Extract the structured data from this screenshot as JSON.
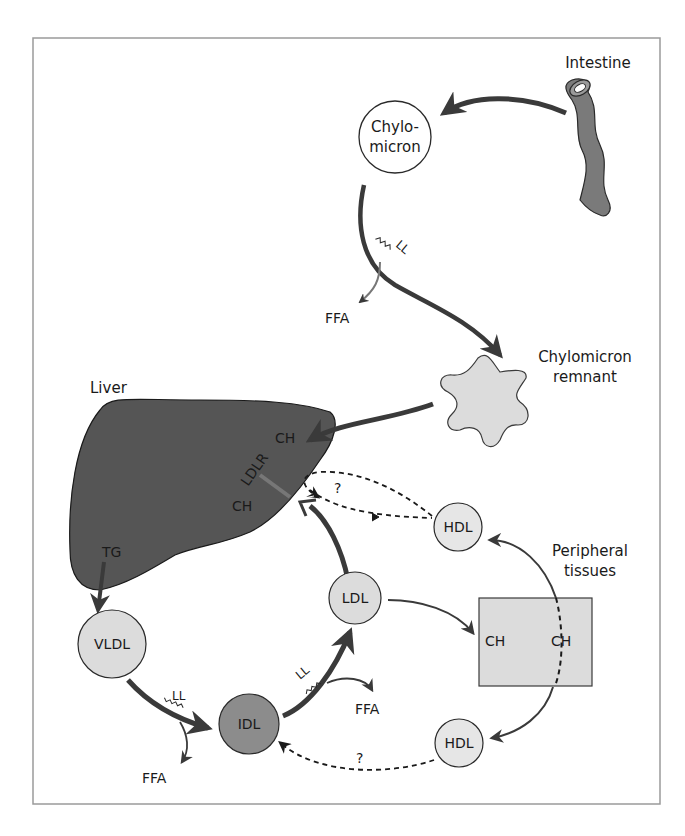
{
  "diagram": {
    "title_regions": {
      "intestine": "Intestine",
      "liver": "Liver",
      "peripheral_line1": "Peripheral",
      "peripheral_line2": "tissues",
      "remnant_line1": "Chylomicron",
      "remnant_line2": "remnant"
    },
    "nodes": {
      "chylomicron_line1": "Chylo-",
      "chylomicron_line2": "micron",
      "vldl": "VLDL",
      "idl": "IDL",
      "ldl": "LDL",
      "hdl_top": "HDL",
      "hdl_bottom": "HDL"
    },
    "liver_labels": {
      "ch_top": "CH",
      "ldlr": "LDLR",
      "ch_bottom": "CH",
      "tg": "TG"
    },
    "tissue_labels": {
      "ch_left": "CH",
      "ch_right": "CH"
    },
    "enzymes": {
      "ll_chylo": "LL",
      "ll_vldl": "LL",
      "ll_idl": "LL"
    },
    "products": {
      "ffa_chylo": "FFA",
      "ffa_vldl": "FFA",
      "ffa_idl": "FFA"
    },
    "unknowns": {
      "q_liver_hdl": "?",
      "q_hdl_idl": "?"
    },
    "colors": {
      "arrow": "#3a3a3a",
      "liver_fill": "#555555",
      "node_light": "#dcdcdc",
      "node_dark": "#8c8c8c",
      "frame": "#9a9a9a"
    }
  }
}
